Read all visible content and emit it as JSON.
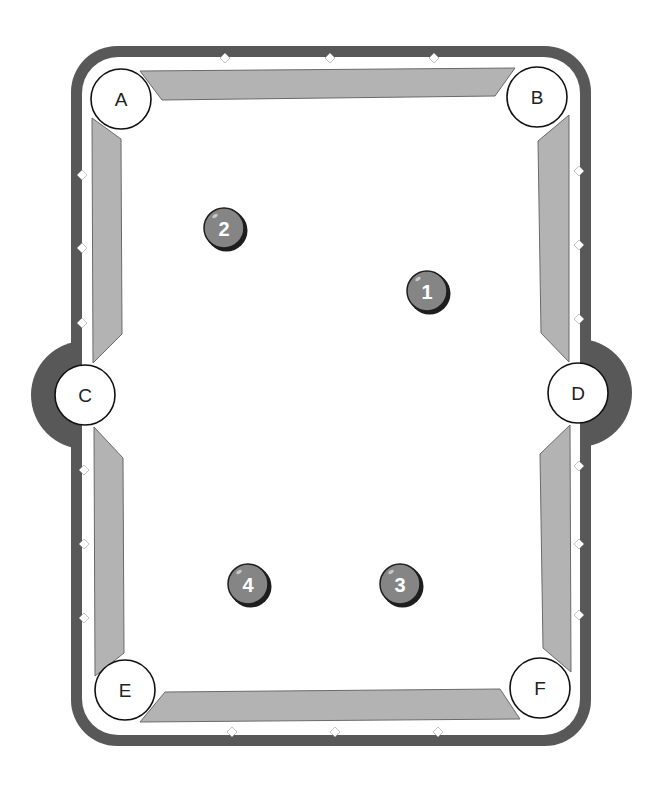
{
  "diagram": {
    "title": "",
    "type": "pool-table-layout",
    "colors": {
      "rail": "#585858",
      "cushion": "#b3b3b3",
      "felt": "#ffffff",
      "ball": "#858585",
      "ball_outline": "#1e1e1e",
      "diamond": "#ffffff"
    },
    "pockets": [
      {
        "id": "A",
        "label": "A",
        "x": 121,
        "y": 99
      },
      {
        "id": "B",
        "label": "B",
        "x": 537,
        "y": 97
      },
      {
        "id": "C",
        "label": "C",
        "x": 85,
        "y": 395
      },
      {
        "id": "D",
        "label": "D",
        "x": 578,
        "y": 393
      },
      {
        "id": "E",
        "label": "E",
        "x": 125,
        "y": 690
      },
      {
        "id": "F",
        "label": "F",
        "x": 540,
        "y": 688
      }
    ],
    "balls": [
      {
        "number": "1",
        "x": 427,
        "y": 291
      },
      {
        "number": "2",
        "x": 224,
        "y": 228
      },
      {
        "number": "3",
        "x": 400,
        "y": 584
      },
      {
        "number": "4",
        "x": 248,
        "y": 584
      }
    ],
    "diamonds": {
      "top": [
        225,
        330,
        434
      ],
      "bottom": [
        232,
        335,
        438
      ],
      "left": [
        175,
        248,
        323,
        470,
        544,
        618
      ],
      "right": [
        171,
        245,
        319,
        466,
        544,
        615
      ]
    }
  }
}
